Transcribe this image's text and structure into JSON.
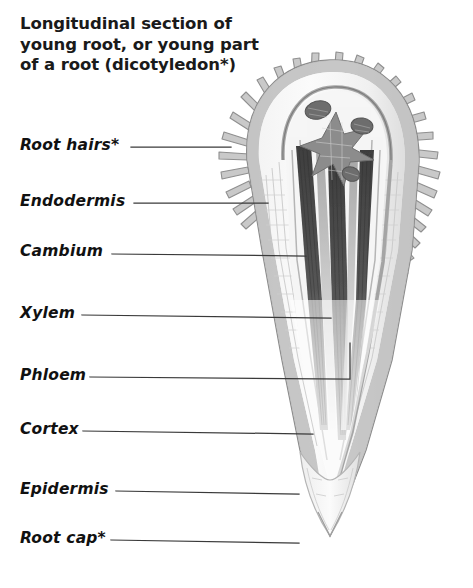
{
  "figure": {
    "title": "Longitudinal section of young root, or young part of a root (dicotyledon*)",
    "title_lines": [
      "Longitudinal section of",
      "young root, or young part",
      "of a root (dicotyledon*)"
    ],
    "background_color": "#ffffff",
    "ink_color": "#111111",
    "leader_color": "#3a3a3a"
  },
  "labels": [
    {
      "id": "root-hairs",
      "text": "Root hairs*",
      "x": 20,
      "y": 148,
      "leader": {
        "x1": 131,
        "y1": 147,
        "x2": 231,
        "y2": 147,
        "elbow": false
      }
    },
    {
      "id": "endodermis",
      "text": "Endodermis",
      "x": 20,
      "y": 204,
      "leader": {
        "x1": 134,
        "y1": 203,
        "x2": 268,
        "y2": 203,
        "elbow": false
      }
    },
    {
      "id": "cambium",
      "text": "Cambium",
      "x": 20,
      "y": 254,
      "leader": {
        "x1": 112,
        "y1": 254,
        "x2": 306,
        "y2": 256,
        "elbow": false
      }
    },
    {
      "id": "xylem",
      "text": "Xylem",
      "x": 20,
      "y": 316,
      "leader": {
        "x1": 82,
        "y1": 315,
        "x2": 331,
        "y2": 318,
        "elbow": false
      }
    },
    {
      "id": "phloem",
      "text": "Phloem",
      "x": 20,
      "y": 378,
      "leader": {
        "x1": 90,
        "y1": 377,
        "x2": 350,
        "y2": 379,
        "elbow": true,
        "ex": 350,
        "ey": 343
      }
    },
    {
      "id": "cortex",
      "text": "Cortex",
      "x": 20,
      "y": 432,
      "leader": {
        "x1": 83,
        "y1": 431,
        "x2": 313,
        "y2": 434,
        "elbow": false
      }
    },
    {
      "id": "epidermis",
      "text": "Epidermis",
      "x": 20,
      "y": 492,
      "leader": {
        "x1": 116,
        "y1": 491,
        "x2": 299,
        "y2": 494,
        "elbow": false
      }
    },
    {
      "id": "root-cap",
      "text": "Root cap*",
      "x": 20,
      "y": 541,
      "leader": {
        "x1": 111,
        "y1": 540,
        "x2": 299,
        "y2": 543,
        "elbow": false
      }
    }
  ],
  "illustration": {
    "name": "root-longitudinal-section",
    "parts": [
      {
        "name": "root-hairs",
        "description": "finger-like projections radiating from epidermis",
        "tone": "#9a9a9a"
      },
      {
        "name": "epidermis",
        "description": "outer cell layer of root",
        "tone": "#b8b8b8"
      },
      {
        "name": "cortex",
        "description": "broad parenchyma tissue between epidermis and stele",
        "tone": "#ededed"
      },
      {
        "name": "endodermis",
        "description": "inner boundary layer of cortex",
        "tone": "#c4c4c4"
      },
      {
        "name": "cambium",
        "description": "meristem layer within stele",
        "tone": "#a8a8a8"
      },
      {
        "name": "xylem",
        "description": "dark water-conducting vascular strands",
        "tone": "#4a4a4a"
      },
      {
        "name": "phloem",
        "description": "food-conducting strands beside xylem",
        "tone": "#767676"
      },
      {
        "name": "root-cap",
        "description": "protective tissue at root apex",
        "tone": "#dcdcdc"
      },
      {
        "name": "meristem",
        "description": "star-shaped apical meristem region at tip of stele",
        "tone": "#8e8e8e"
      }
    ]
  }
}
